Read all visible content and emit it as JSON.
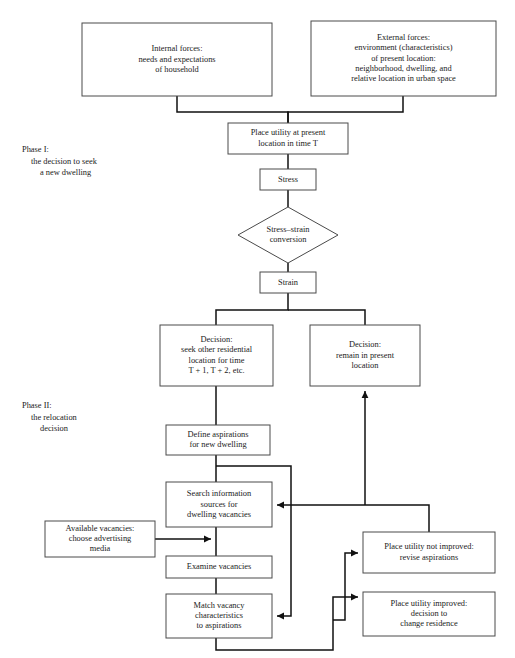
{
  "figure": {
    "background_color": "#ffffff",
    "line_color": "#111111",
    "box_border_color": "#4a4a4a",
    "text_color": "#1a1a1a"
  },
  "phases": [
    {
      "id": "phase-1",
      "lines": [
        "Phase I:",
        "the decision to seek",
        "a new dwelling"
      ],
      "x": 22,
      "y": 152
    },
    {
      "id": "phase-2",
      "lines": [
        "Phase II:",
        "the relocation",
        "decision"
      ],
      "x": 22,
      "y": 408
    }
  ],
  "nodes": [
    {
      "id": "internal-forces",
      "shape": "rect",
      "x": 82,
      "y": 23,
      "w": 190,
      "h": 73,
      "lines": [
        "Internal forces:",
        "needs and expectations",
        "of household"
      ]
    },
    {
      "id": "external-forces",
      "shape": "rect",
      "x": 311,
      "y": 21,
      "w": 185,
      "h": 75,
      "lines": [
        "External forces:",
        "environment (characteristics)",
        "of present location:",
        "neighborhood, dwelling, and",
        "relative location in urban space"
      ]
    },
    {
      "id": "place-utility-present",
      "shape": "rect",
      "x": 228,
      "y": 123,
      "w": 120,
      "h": 31,
      "lines": [
        "Place utility at present",
        "location in time T"
      ]
    },
    {
      "id": "stress",
      "shape": "rect",
      "x": 260,
      "y": 169,
      "w": 56,
      "h": 21,
      "lines": [
        "Stress"
      ]
    },
    {
      "id": "stress-strain-conversion",
      "shape": "diamond",
      "x": 238,
      "y": 207,
      "w": 100,
      "h": 56,
      "lines": [
        "Stress–strain",
        "conversion"
      ]
    },
    {
      "id": "strain",
      "shape": "rect",
      "x": 260,
      "y": 272,
      "w": 56,
      "h": 21,
      "lines": [
        "Strain"
      ]
    },
    {
      "id": "decision-seek-other",
      "shape": "rect",
      "x": 160,
      "y": 325,
      "w": 113,
      "h": 61,
      "lines": [
        "Decision:",
        "seek other residential",
        "location for time",
        "T + 1, T + 2, etc."
      ]
    },
    {
      "id": "decision-remain",
      "shape": "rect",
      "x": 310,
      "y": 325,
      "w": 110,
      "h": 61,
      "lines": [
        "Decision:",
        "remain in present",
        "location"
      ]
    },
    {
      "id": "define-aspirations",
      "shape": "rect",
      "x": 166,
      "y": 425,
      "w": 104,
      "h": 30,
      "lines": [
        "Define aspirations",
        "for new dwelling"
      ]
    },
    {
      "id": "search-information",
      "shape": "rect",
      "x": 166,
      "y": 482,
      "w": 106,
      "h": 45,
      "lines": [
        "Search information",
        "sources for",
        "dwelling vacancies"
      ]
    },
    {
      "id": "available-vacancies",
      "shape": "rect",
      "x": 45,
      "y": 521,
      "w": 110,
      "h": 36,
      "lines": [
        "Available vacancies:",
        "choose advertising",
        "media"
      ]
    },
    {
      "id": "examine-vacancies",
      "shape": "rect",
      "x": 166,
      "y": 556,
      "w": 106,
      "h": 22,
      "lines": [
        "Examine vacancies"
      ]
    },
    {
      "id": "match-vacancy",
      "shape": "rect",
      "x": 166,
      "y": 594,
      "w": 106,
      "h": 44,
      "lines": [
        "Match vacancy",
        "characteristics",
        "to aspirations"
      ]
    },
    {
      "id": "place-utility-not-improved",
      "shape": "rect",
      "x": 363,
      "y": 532,
      "w": 132,
      "h": 41,
      "lines": [
        "Place utility not improved:",
        "revise aspirations"
      ]
    },
    {
      "id": "place-utility-improved",
      "shape": "rect",
      "x": 363,
      "y": 592,
      "w": 132,
      "h": 44,
      "lines": [
        "Place utility improved:",
        "decision to",
        "change residence"
      ]
    }
  ],
  "connectors": [
    {
      "id": "internal-to-place-utility",
      "points": "177,96 177,112 288,112 288,123",
      "arrow": "none"
    },
    {
      "id": "external-to-place-utility",
      "points": "403,96 403,112 288,112 288,123",
      "arrow": "none"
    },
    {
      "id": "place-utility-to-stress",
      "points": "288,154 288,169",
      "arrow": "none"
    },
    {
      "id": "stress-to-conversion",
      "points": "288,190 288,207",
      "arrow": "none"
    },
    {
      "id": "conversion-to-strain",
      "points": "288,263 288,272",
      "arrow": "none"
    },
    {
      "id": "strain-split",
      "points": "288,293 288,310 216,310 216,325",
      "arrow": "none"
    },
    {
      "id": "strain-to-remain",
      "points": "288,310 365,310 365,325",
      "arrow": "none"
    },
    {
      "id": "seek-other-to-define",
      "points": "216,386 216,425",
      "arrow": "none"
    },
    {
      "id": "define-to-search",
      "points": "216,455 216,482",
      "arrow": "none"
    },
    {
      "id": "define-branch-to-match",
      "points": "216,466 291,466 291,616 277,616",
      "arrow": "left"
    },
    {
      "id": "search-to-examine",
      "points": "216,527 216,556",
      "arrow": "none"
    },
    {
      "id": "examine-to-match",
      "points": "216,578 216,594",
      "arrow": "none"
    },
    {
      "id": "available-to-search-column",
      "points": "155,539 211,539",
      "arrow": "right"
    },
    {
      "id": "match-bottom-loop",
      "points": "216,638 216,650 333,650 333,597 358,597",
      "arrow": "right"
    },
    {
      "id": "match-bottom-loop-upper",
      "points": "333,620 345,620 345,553 358,553",
      "arrow": "right"
    },
    {
      "id": "not-improved-back-to-search",
      "points": "429,532 429,505 277,505",
      "arrow": "left"
    },
    {
      "id": "improved-to-remain",
      "points": "365,505 365,391",
      "arrow": "up"
    }
  ]
}
